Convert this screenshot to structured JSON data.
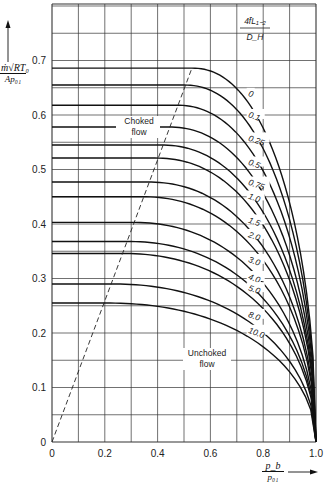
{
  "chart_data": {
    "type": "line",
    "title": "",
    "xlabel": "p_b / p_01",
    "ylabel": "m·sqrt(R·T0) / (A·p01)",
    "xlim": [
      0,
      1.0
    ],
    "ylim": [
      0,
      0.8
    ],
    "grid": true,
    "x_ticks": [
      "0",
      "0.2",
      "0.4",
      "0.6",
      "0.8",
      "1.0"
    ],
    "y_ticks": [
      "0",
      "0.1",
      "0.2",
      "0.3",
      "0.4",
      "0.5",
      "0.6",
      "0.7"
    ],
    "parameter_label": "4fL1-2 / D_H",
    "series": [
      {
        "name": "0",
        "choked_value": 0.686,
        "break_x": 0.53
      },
      {
        "name": "0.1",
        "choked_value": 0.655,
        "break_x": 0.5
      },
      {
        "name": "0.25",
        "choked_value": 0.618,
        "break_x": 0.47
      },
      {
        "name": "0.5",
        "choked_value": 0.578,
        "break_x": 0.44
      },
      {
        "name": "0.75",
        "choked_value": 0.545,
        "break_x": 0.41
      },
      {
        "name": "1.0",
        "choked_value": 0.521,
        "break_x": 0.39
      },
      {
        "name": "1.5",
        "choked_value": 0.477,
        "break_x": 0.36
      },
      {
        "name": "2.0",
        "choked_value": 0.45,
        "break_x": 0.34
      },
      {
        "name": "3.0",
        "choked_value": 0.403,
        "break_x": 0.3
      },
      {
        "name": "4.0",
        "choked_value": 0.368,
        "break_x": 0.28
      },
      {
        "name": "5.0",
        "choked_value": 0.346,
        "break_x": 0.26
      },
      {
        "name": "8.0",
        "choked_value": 0.29,
        "break_x": 0.22
      },
      {
        "name": "10.0",
        "choked_value": 0.255,
        "break_x": 0.2
      }
    ],
    "annotations": [
      {
        "text": "Choked flow",
        "x": 0.33,
        "y": 0.575
      },
      {
        "text": "Unchoked flow",
        "x": 0.61,
        "y": 0.15
      }
    ],
    "choking_boundary": {
      "style": "dashed",
      "from": [
        0,
        0
      ],
      "to": [
        0.53,
        0.686
      ]
    },
    "legend_position": "inline labels near curve ends"
  },
  "labels": {
    "y_num": "ṁ√RT₀",
    "y_den": "Ap₀₁",
    "x_num": "p_b",
    "x_den": "p₀₁",
    "param_num": "4f̄L₁₋₂",
    "param_den": "D_H",
    "choked_1": "Choked",
    "choked_2": "flow",
    "unchoked_1": "Unchoked",
    "unchoked_2": "flow"
  }
}
